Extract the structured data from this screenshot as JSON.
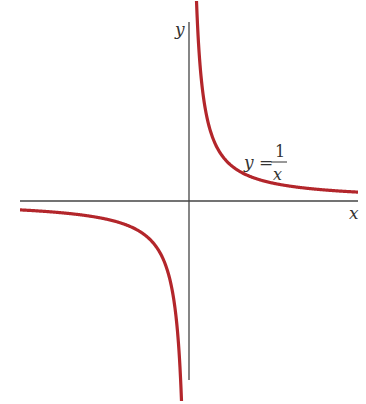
{
  "chart_data": {
    "type": "line",
    "title": "",
    "function": "y = 1/x",
    "xlabel": "x",
    "ylabel": "y",
    "annotation": {
      "lhs": "y =",
      "numerator": "1",
      "denominator": "x"
    },
    "grid": false,
    "legend": "none",
    "series": [
      {
        "name": "y = 1/x (x > 0)",
        "x": [
          0.05,
          0.1,
          0.2,
          0.5,
          1,
          2,
          5,
          10
        ],
        "y": [
          20,
          10,
          5,
          2,
          1,
          0.5,
          0.2,
          0.1
        ]
      },
      {
        "name": "y = 1/x (x < 0)",
        "x": [
          -10,
          -5,
          -2,
          -1,
          -0.5,
          -0.2,
          -0.1,
          -0.05
        ],
        "y": [
          -0.1,
          -0.2,
          -0.5,
          -1,
          -2,
          -5,
          -10,
          -20
        ]
      }
    ],
    "colors": {
      "curve": "#b3262b",
      "axes": "#444444"
    }
  },
  "labels": {
    "x_axis": "x",
    "y_axis": "y",
    "eq_lhs": "y =",
    "eq_num": "1",
    "eq_den": "x"
  }
}
